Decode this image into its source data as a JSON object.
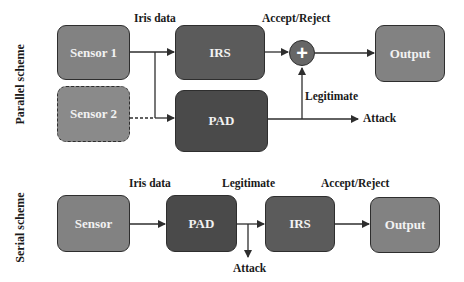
{
  "parallel": {
    "title": "Parallel scheme",
    "sensor1": "Sensor 1",
    "sensor2": "Sensor 2",
    "irs": "IRS",
    "pad": "PAD",
    "combiner": "+",
    "output": "Output",
    "labels": {
      "iris_data": "Iris data",
      "accept_reject": "Accept/Reject",
      "legitimate": "Legitimate",
      "attack": "Attack"
    }
  },
  "serial": {
    "title": "Serial scheme",
    "sensor": "Sensor",
    "pad": "PAD",
    "irs": "IRS",
    "output": "Output",
    "labels": {
      "iris_data": "Iris data",
      "legitimate": "Legitimate",
      "accept_reject": "Accept/Reject",
      "attack": "Attack"
    }
  },
  "colors": {
    "sensor": "#828282",
    "irs": "#5b5b5b",
    "pad": "#4a4a4a",
    "output": "#828282",
    "line": "#2e2e2e"
  }
}
